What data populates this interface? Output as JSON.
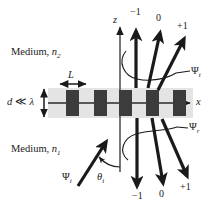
{
  "figure": {
    "name": "diffraction-grating-orders-diagram",
    "background": "#ffffff",
    "ink": "#1a1a1a",
    "grating_bar_color": "#3c3c3c",
    "grating_band_color": "#e2e2e2"
  },
  "axes": {
    "x_label": "x",
    "z_label": "z"
  },
  "media": {
    "upper_label_prefix": "Medium, ",
    "upper_symbol": "n",
    "upper_sub": "2",
    "lower_label_prefix": "Medium, ",
    "lower_symbol": "n",
    "lower_sub": "1"
  },
  "dimensions": {
    "period_label": "L",
    "thickness_label": "d ≪ λ"
  },
  "beams": {
    "incident": {
      "label": "Ψ",
      "sub": "i"
    },
    "transmitted": {
      "label": "Ψ",
      "sub": "t"
    },
    "reflected": {
      "label": "Ψ",
      "sub": "r"
    },
    "angle": {
      "label": "θ",
      "sub": "i"
    }
  },
  "orders": {
    "transmitted": [
      "−1",
      "0",
      "+1"
    ],
    "reflected": [
      "−1",
      "0",
      "+1"
    ]
  },
  "grating": {
    "bar_count": 5,
    "bars_x": [
      66,
      94,
      119,
      146,
      173
    ]
  }
}
